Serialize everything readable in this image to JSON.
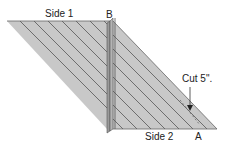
{
  "diagram": {
    "labels": {
      "side1": "Side 1",
      "side2": "Side 2",
      "pointA": "A",
      "pointB": "B",
      "cut": "Cut 5\"."
    },
    "colors": {
      "fabric": "#c8c8c8",
      "fabricDark": "#a8a8a8",
      "seam": "#555555",
      "outline": "#666666"
    }
  }
}
